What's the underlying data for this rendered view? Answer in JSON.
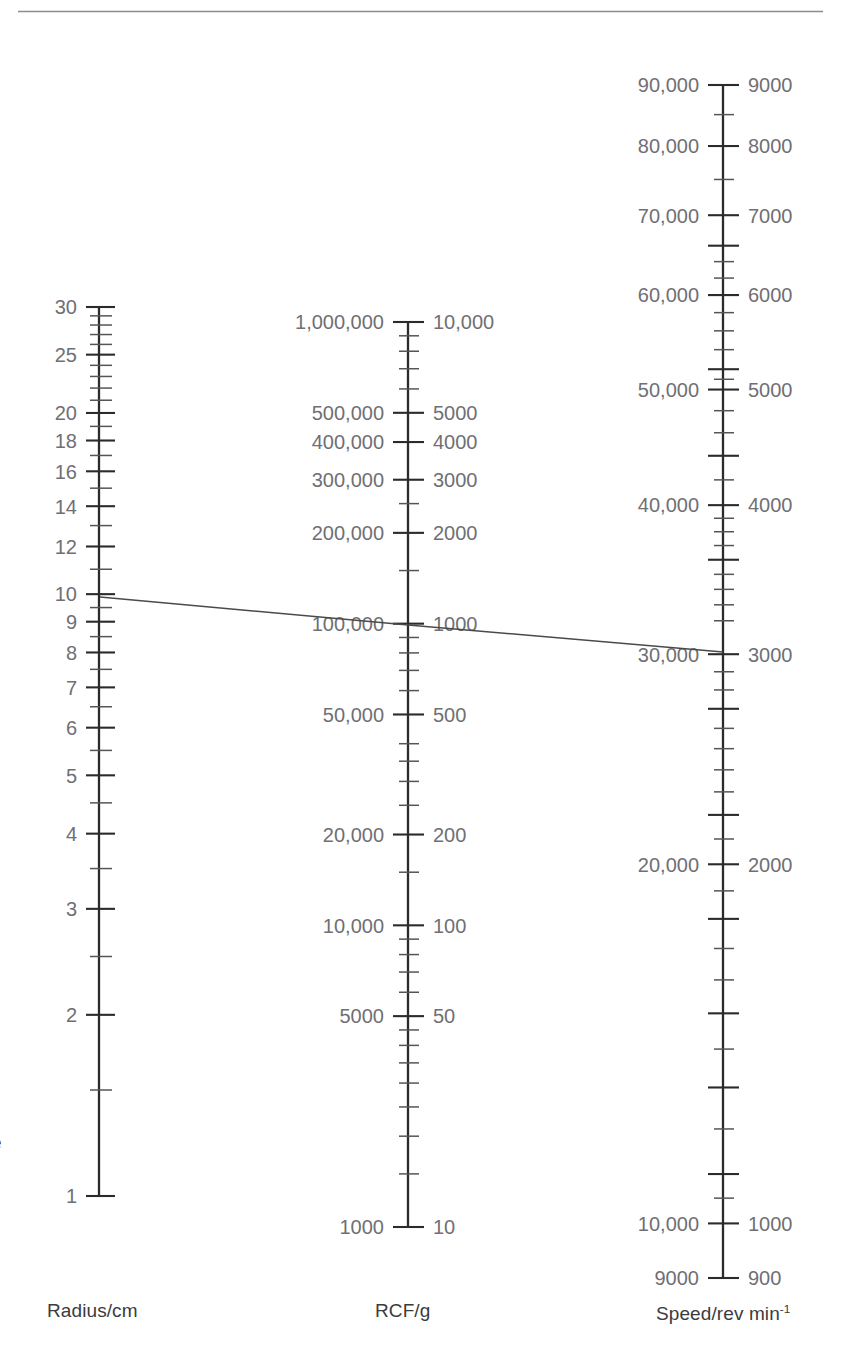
{
  "page": {
    "background": "#ffffff",
    "top_rule_color": "#8b8b93",
    "axis_color": "#2b2b2b",
    "tick_color": "#555558",
    "label_color": "#6f6f74",
    "caption_color": "#3b3b3d",
    "line_color": "#4a4a4a",
    "clipped_left_text": "e"
  },
  "chart_data": {
    "type": "nomogram",
    "title": "",
    "grid": false,
    "legend": false,
    "axes": [
      {
        "id": "radius",
        "caption": "Radius/cm",
        "caption_x": 47,
        "caption_y": 1300,
        "x": 99,
        "y_top": 307,
        "y_bottom": 1196,
        "scale": "log",
        "range": [
          1,
          30
        ],
        "label_side": "left",
        "ticks": [
          {
            "value": 30,
            "label": "30",
            "size": "major"
          },
          {
            "value": 29,
            "label": "",
            "size": "minor"
          },
          {
            "value": 28,
            "label": "",
            "size": "minor"
          },
          {
            "value": 27,
            "label": "",
            "size": "minor"
          },
          {
            "value": 26,
            "label": "",
            "size": "minor"
          },
          {
            "value": 25,
            "label": "25",
            "size": "major"
          },
          {
            "value": 24,
            "label": "",
            "size": "minor"
          },
          {
            "value": 23,
            "label": "",
            "size": "minor"
          },
          {
            "value": 22,
            "label": "",
            "size": "minor"
          },
          {
            "value": 21,
            "label": "",
            "size": "minor"
          },
          {
            "value": 20,
            "label": "20",
            "size": "major"
          },
          {
            "value": 19,
            "label": "",
            "size": "minor"
          },
          {
            "value": 18,
            "label": "18",
            "size": "major"
          },
          {
            "value": 17,
            "label": "",
            "size": "minor"
          },
          {
            "value": 16,
            "label": "16",
            "size": "major"
          },
          {
            "value": 15,
            "label": "",
            "size": "minor"
          },
          {
            "value": 14,
            "label": "14",
            "size": "major"
          },
          {
            "value": 13,
            "label": "",
            "size": "minor"
          },
          {
            "value": 12,
            "label": "12",
            "size": "major"
          },
          {
            "value": 11,
            "label": "",
            "size": "minor"
          },
          {
            "value": 10,
            "label": "10",
            "size": "major"
          },
          {
            "value": 9.5,
            "label": "",
            "size": "minor"
          },
          {
            "value": 9,
            "label": "9",
            "size": "major"
          },
          {
            "value": 8.5,
            "label": "",
            "size": "minor"
          },
          {
            "value": 8,
            "label": "8",
            "size": "major"
          },
          {
            "value": 7.5,
            "label": "",
            "size": "minor"
          },
          {
            "value": 7,
            "label": "7",
            "size": "major"
          },
          {
            "value": 6.5,
            "label": "",
            "size": "minor"
          },
          {
            "value": 6,
            "label": "6",
            "size": "major"
          },
          {
            "value": 5.5,
            "label": "",
            "size": "minor"
          },
          {
            "value": 5,
            "label": "5",
            "size": "major"
          },
          {
            "value": 4.5,
            "label": "",
            "size": "minor"
          },
          {
            "value": 4,
            "label": "4",
            "size": "major"
          },
          {
            "value": 3.5,
            "label": "",
            "size": "minor"
          },
          {
            "value": 3,
            "label": "3",
            "size": "major"
          },
          {
            "value": 2.5,
            "label": "",
            "size": "minor"
          },
          {
            "value": 2,
            "label": "2",
            "size": "major"
          },
          {
            "value": 1.5,
            "label": "",
            "size": "minor"
          },
          {
            "value": 1,
            "label": "1",
            "size": "major"
          }
        ]
      },
      {
        "id": "rcf",
        "caption": "RCF/g",
        "caption_x": 375,
        "caption_y": 1300,
        "x": 408,
        "y_top": 322,
        "y_bottom": 1227,
        "scale": "log",
        "range": [
          1000,
          1000000
        ],
        "label_side": "both",
        "ticks": [
          {
            "value": 1000000,
            "label_left": "1,000,000",
            "label_right": "10,000",
            "size": "major"
          },
          {
            "value": 900000,
            "label_left": "",
            "label_right": "",
            "size": "minor"
          },
          {
            "value": 800000,
            "label_left": "",
            "label_right": "",
            "size": "minor"
          },
          {
            "value": 700000,
            "label_left": "",
            "label_right": "",
            "size": "minor"
          },
          {
            "value": 600000,
            "label_left": "",
            "label_right": "",
            "size": "minor"
          },
          {
            "value": 500000,
            "label_left": "500,000",
            "label_right": "5000",
            "size": "major"
          },
          {
            "value": 400000,
            "label_left": "400,000",
            "label_right": "4000",
            "size": "major"
          },
          {
            "value": 300000,
            "label_left": "300,000",
            "label_right": "3000",
            "size": "major"
          },
          {
            "value": 250000,
            "label_left": "",
            "label_right": "",
            "size": "minor"
          },
          {
            "value": 200000,
            "label_left": "200,000",
            "label_right": "2000",
            "size": "major"
          },
          {
            "value": 150000,
            "label_left": "",
            "label_right": "",
            "size": "minor"
          },
          {
            "value": 100000,
            "label_left": "100,000",
            "label_right": "1000",
            "size": "major"
          },
          {
            "value": 90000,
            "label_left": "",
            "label_right": "",
            "size": "minor"
          },
          {
            "value": 80000,
            "label_left": "",
            "label_right": "",
            "size": "minor"
          },
          {
            "value": 70000,
            "label_left": "",
            "label_right": "",
            "size": "minor"
          },
          {
            "value": 60000,
            "label_left": "",
            "label_right": "",
            "size": "minor"
          },
          {
            "value": 50000,
            "label_left": "50,000",
            "label_right": "500",
            "size": "major"
          },
          {
            "value": 40000,
            "label_left": "",
            "label_right": "",
            "size": "minor"
          },
          {
            "value": 35000,
            "label_left": "",
            "label_right": "",
            "size": "minor"
          },
          {
            "value": 30000,
            "label_left": "",
            "label_right": "",
            "size": "minor"
          },
          {
            "value": 25000,
            "label_left": "",
            "label_right": "",
            "size": "minor"
          },
          {
            "value": 20000,
            "label_left": "20,000",
            "label_right": "200",
            "size": "major"
          },
          {
            "value": 15000,
            "label_left": "",
            "label_right": "",
            "size": "minor"
          },
          {
            "value": 10000,
            "label_left": "10,000",
            "label_right": "100",
            "size": "major"
          },
          {
            "value": 9000,
            "label_left": "",
            "label_right": "",
            "size": "minor"
          },
          {
            "value": 8000,
            "label_left": "",
            "label_right": "",
            "size": "minor"
          },
          {
            "value": 7000,
            "label_left": "",
            "label_right": "",
            "size": "minor"
          },
          {
            "value": 6000,
            "label_left": "",
            "label_right": "",
            "size": "minor"
          },
          {
            "value": 5000,
            "label_left": "5000",
            "label_right": "50",
            "size": "major"
          },
          {
            "value": 4500,
            "label_left": "",
            "label_right": "",
            "size": "minor"
          },
          {
            "value": 4000,
            "label_left": "",
            "label_right": "",
            "size": "minor"
          },
          {
            "value": 3500,
            "label_left": "",
            "label_right": "",
            "size": "minor"
          },
          {
            "value": 3000,
            "label_left": "",
            "label_right": "",
            "size": "minor"
          },
          {
            "value": 2500,
            "label_left": "",
            "label_right": "",
            "size": "minor"
          },
          {
            "value": 2000,
            "label_left": "",
            "label_right": "",
            "size": "minor"
          },
          {
            "value": 1500,
            "label_left": "",
            "label_right": "",
            "size": "minor"
          },
          {
            "value": 1000,
            "label_left": "1000",
            "label_right": "10",
            "size": "major"
          }
        ]
      },
      {
        "id": "speed",
        "caption": "Speed/rev min",
        "caption_sup": "-1",
        "caption_x": 656,
        "caption_y": 1303,
        "x": 723,
        "y_top": 85,
        "y_bottom": 1278,
        "scale": "log",
        "range": [
          900,
          9000
        ],
        "label_side": "both",
        "ticks": [
          {
            "value": 9000,
            "label_left": "90,000",
            "label_right": "9000",
            "size": "major"
          },
          {
            "value": 8500,
            "label_left": "",
            "label_right": "",
            "size": "minor"
          },
          {
            "value": 8000,
            "label_left": "80,000",
            "label_right": "8000",
            "size": "major"
          },
          {
            "value": 7500,
            "label_left": "",
            "label_right": "",
            "size": "minor"
          },
          {
            "value": 7000,
            "label_left": "70,000",
            "label_right": "7000",
            "size": "major"
          },
          {
            "value": 6600,
            "label_left": "",
            "label_right": "",
            "size": "major"
          },
          {
            "value": 6400,
            "label_left": "",
            "label_right": "",
            "size": "minor"
          },
          {
            "value": 6200,
            "label_left": "",
            "label_right": "",
            "size": "minor"
          },
          {
            "value": 6000,
            "label_left": "60,000",
            "label_right": "6000",
            "size": "major"
          },
          {
            "value": 5800,
            "label_left": "",
            "label_right": "",
            "size": "minor"
          },
          {
            "value": 5600,
            "label_left": "",
            "label_right": "",
            "size": "minor"
          },
          {
            "value": 5400,
            "label_left": "",
            "label_right": "",
            "size": "minor"
          },
          {
            "value": 5200,
            "label_left": "",
            "label_right": "",
            "size": "major"
          },
          {
            "value": 5100,
            "label_left": "",
            "label_right": "",
            "size": "minor"
          },
          {
            "value": 5000,
            "label_left": "50,000",
            "label_right": "5000",
            "size": "major"
          },
          {
            "value": 4800,
            "label_left": "",
            "label_right": "",
            "size": "minor"
          },
          {
            "value": 4600,
            "label_left": "",
            "label_right": "",
            "size": "minor"
          },
          {
            "value": 4400,
            "label_left": "",
            "label_right": "",
            "size": "major"
          },
          {
            "value": 4200,
            "label_left": "",
            "label_right": "",
            "size": "minor"
          },
          {
            "value": 4000,
            "label_left": "40,000",
            "label_right": "4000",
            "size": "major"
          },
          {
            "value": 3900,
            "label_left": "",
            "label_right": "",
            "size": "minor"
          },
          {
            "value": 3800,
            "label_left": "",
            "label_right": "",
            "size": "minor"
          },
          {
            "value": 3700,
            "label_left": "",
            "label_right": "",
            "size": "minor"
          },
          {
            "value": 3600,
            "label_left": "",
            "label_right": "",
            "size": "major"
          },
          {
            "value": 3500,
            "label_left": "",
            "label_right": "",
            "size": "minor"
          },
          {
            "value": 3400,
            "label_left": "",
            "label_right": "",
            "size": "minor"
          },
          {
            "value": 3300,
            "label_left": "",
            "label_right": "",
            "size": "minor"
          },
          {
            "value": 3200,
            "label_left": "",
            "label_right": "",
            "size": "minor"
          },
          {
            "value": 3000,
            "label_left": "30,000",
            "label_right": "3000",
            "size": "major"
          },
          {
            "value": 2900,
            "label_left": "",
            "label_right": "",
            "size": "minor"
          },
          {
            "value": 2800,
            "label_left": "",
            "label_right": "",
            "size": "minor"
          },
          {
            "value": 2700,
            "label_left": "",
            "label_right": "",
            "size": "major"
          },
          {
            "value": 2600,
            "label_left": "",
            "label_right": "",
            "size": "minor"
          },
          {
            "value": 2500,
            "label_left": "",
            "label_right": "",
            "size": "minor"
          },
          {
            "value": 2400,
            "label_left": "",
            "label_right": "",
            "size": "minor"
          },
          {
            "value": 2300,
            "label_left": "",
            "label_right": "",
            "size": "minor"
          },
          {
            "value": 2200,
            "label_left": "",
            "label_right": "",
            "size": "major"
          },
          {
            "value": 2100,
            "label_left": "",
            "label_right": "",
            "size": "minor"
          },
          {
            "value": 2000,
            "label_left": "20,000",
            "label_right": "2000",
            "size": "major"
          },
          {
            "value": 1900,
            "label_left": "",
            "label_right": "",
            "size": "minor"
          },
          {
            "value": 1800,
            "label_left": "",
            "label_right": "",
            "size": "major"
          },
          {
            "value": 1700,
            "label_left": "",
            "label_right": "",
            "size": "minor"
          },
          {
            "value": 1600,
            "label_left": "",
            "label_right": "",
            "size": "minor"
          },
          {
            "value": 1500,
            "label_left": "",
            "label_right": "",
            "size": "major"
          },
          {
            "value": 1400,
            "label_left": "",
            "label_right": "",
            "size": "minor"
          },
          {
            "value": 1300,
            "label_left": "",
            "label_right": "",
            "size": "major"
          },
          {
            "value": 1200,
            "label_left": "",
            "label_right": "",
            "size": "minor"
          },
          {
            "value": 1100,
            "label_left": "",
            "label_right": "",
            "size": "major"
          },
          {
            "value": 1050,
            "label_left": "",
            "label_right": "",
            "size": "minor"
          },
          {
            "value": 1000,
            "label_left": "10,000",
            "label_right": "1000",
            "size": "major"
          },
          {
            "value": 900,
            "label_left": "9000",
            "label_right": "900",
            "size": "major"
          }
        ]
      }
    ],
    "connector_line": {
      "label": "worked-example-isopleth",
      "points": [
        {
          "axis": "radius",
          "value": 10,
          "x": 100,
          "y": 597
        },
        {
          "axis": "rcf",
          "value": 100000,
          "x": 408,
          "y": 625
        },
        {
          "axis": "speed",
          "value": 3000,
          "x": 723,
          "y": 652
        }
      ]
    }
  }
}
